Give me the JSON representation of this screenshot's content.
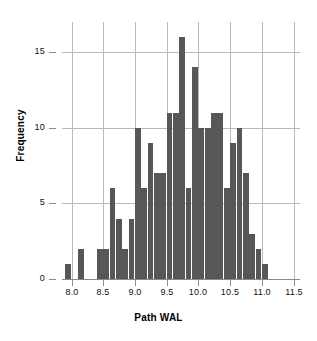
{
  "chart_data": {
    "type": "bar",
    "title": "",
    "xlabel": "Path WAL",
    "ylabel": "Frequency",
    "xlim": [
      7.85,
      11.6
    ],
    "ylim": [
      0,
      17
    ],
    "grid": true,
    "legend": null,
    "bar_color": "#575757",
    "grid_color": "#b8b8b8",
    "bin_width": 0.1,
    "bin_start": 7.9,
    "xticks": [
      8.0,
      8.5,
      9.0,
      9.5,
      10.0,
      10.5,
      11.0,
      11.5
    ],
    "xticklabels": [
      "8.0",
      "8.5",
      "9.0",
      "9.5",
      "10.0",
      "10.5",
      "11.0",
      "11.5"
    ],
    "yticks": [
      0,
      5,
      10,
      15
    ],
    "yticklabels": [
      "0",
      "5",
      "10",
      "15"
    ],
    "bin_edges": [
      7.9,
      8.0,
      8.1,
      8.2,
      8.3,
      8.4,
      8.5,
      8.6,
      8.7,
      8.8,
      8.9,
      9.0,
      9.1,
      9.2,
      9.3,
      9.4,
      9.5,
      9.6,
      9.7,
      9.8,
      9.9,
      10.0,
      10.1,
      10.2,
      10.3,
      10.4,
      10.5,
      10.6,
      10.7,
      10.8,
      10.9,
      11.0,
      11.1,
      11.2,
      11.3,
      11.4,
      11.5
    ],
    "categories": [
      "7.9",
      "8.0",
      "8.1",
      "8.2",
      "8.3",
      "8.4",
      "8.5",
      "8.6",
      "8.7",
      "8.8",
      "8.9",
      "9.0",
      "9.1",
      "9.2",
      "9.3",
      "9.4",
      "9.5",
      "9.6",
      "9.7",
      "9.8",
      "9.9",
      "10.0",
      "10.1",
      "10.2",
      "10.3",
      "10.4",
      "10.5",
      "10.6",
      "10.7",
      "10.8",
      "10.9",
      "11.0",
      "11.1",
      "11.2",
      "11.3",
      "11.4"
    ],
    "values": [
      1,
      0,
      2,
      0,
      0,
      2,
      2,
      6,
      4,
      2,
      4,
      10,
      6,
      9,
      7,
      7,
      11,
      11,
      16,
      6,
      14,
      10,
      10,
      11,
      11,
      6,
      9,
      10,
      7,
      3,
      2,
      1,
      0,
      0,
      0,
      0
    ]
  }
}
